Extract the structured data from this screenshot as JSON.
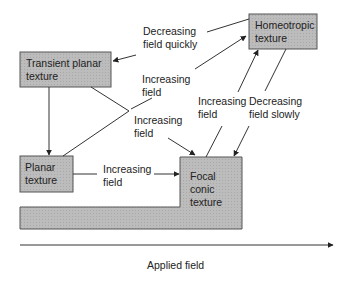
{
  "colors": {
    "box_fill": "#b8b8b8",
    "stroke": "#333333"
  },
  "states": {
    "transient_planar": "Transient planar texture",
    "homeotropic": "Homeotropic texture",
    "planar": "Planar texture",
    "focal_conic": "Focal conic texture"
  },
  "states_lines": {
    "transient_planar": [
      "Transient planar",
      "texture"
    ],
    "homeotropic": [
      "Homeotropic",
      "texture"
    ],
    "planar": [
      "Planar",
      "texture"
    ],
    "focal_conic": [
      "Focal",
      "conic",
      "texture"
    ]
  },
  "transitions": {
    "homeo_to_transient": [
      "Decreasing",
      "field quickly"
    ],
    "transient_to_homeo": [
      "Increasing",
      "field"
    ],
    "transient_to_focal": [
      "Increasing",
      "field"
    ],
    "planar_to_focal": [
      "Increasing",
      "field"
    ],
    "focal_to_homeo": [
      "Increasing",
      "field"
    ],
    "homeo_to_focal": [
      "Decreasing",
      "field slowly"
    ]
  },
  "axis": {
    "label": "Applied field"
  }
}
